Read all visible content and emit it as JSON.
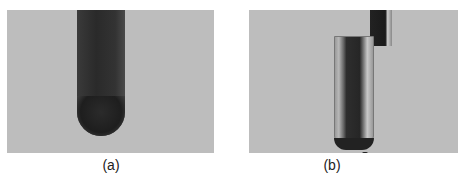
{
  "figure": {
    "panels": [
      {
        "id": "a",
        "caption": "(a)",
        "description": "test tube with dark suspension against gray background"
      },
      {
        "id": "b",
        "caption": "(b)",
        "description": "test tube with clear liquid, dark rod and settled sediment at bottom"
      }
    ]
  }
}
